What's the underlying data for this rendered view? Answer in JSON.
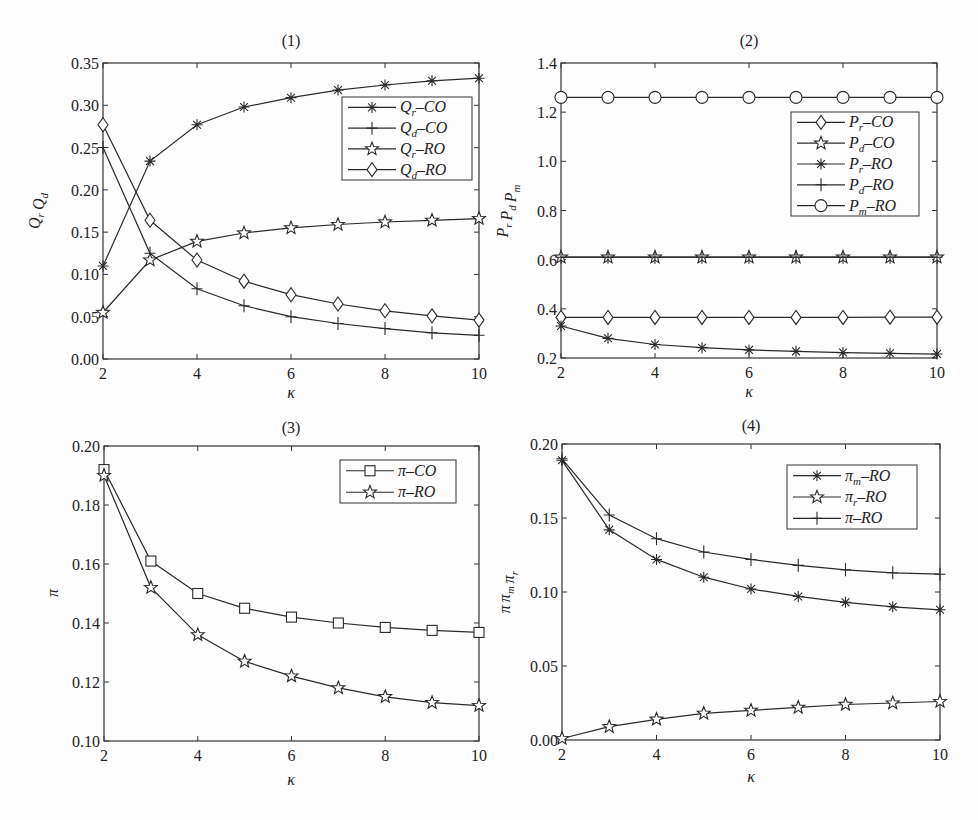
{
  "figure": {
    "panels": [
      "(1)",
      "(2)",
      "(3)",
      "(4)"
    ]
  },
  "colors": {
    "line": "#2a2a2a",
    "background": "#fdfdfd",
    "frame": "#333333"
  },
  "chart_data": [
    {
      "id": "panel-1",
      "type": "line",
      "title": "(1)",
      "xlabel": "κ",
      "ylabel": "Q_r Q_d",
      "x": [
        2,
        3,
        4,
        5,
        6,
        7,
        8,
        9,
        10
      ],
      "xlim": [
        2,
        10
      ],
      "ylim": [
        0,
        0.35
      ],
      "xticks": [
        2,
        4,
        6,
        8,
        10
      ],
      "yticks": [
        0.0,
        0.05,
        0.1,
        0.15,
        0.2,
        0.25,
        0.3,
        0.35
      ],
      "ytick_labels": [
        "0.00",
        "0.05",
        "0.10",
        "0.15",
        "0.20",
        "0.25",
        "0.30",
        "0.35"
      ],
      "grid": false,
      "legend_position": "upper right",
      "series": [
        {
          "name": "Q_r–CO",
          "label_main": "Q",
          "label_sub": "r",
          "label_rest": "–CO",
          "marker": "asterisk",
          "values": [
            0.11,
            0.234,
            0.277,
            0.298,
            0.309,
            0.318,
            0.324,
            0.329,
            0.332
          ]
        },
        {
          "name": "Q_d–CO",
          "label_main": "Q",
          "label_sub": "d",
          "label_rest": "–CO",
          "marker": "plus",
          "values": [
            0.25,
            0.125,
            0.083,
            0.063,
            0.05,
            0.042,
            0.036,
            0.031,
            0.028
          ]
        },
        {
          "name": "Q_r–RO",
          "label_main": "Q",
          "label_sub": "r",
          "label_rest": "–RO",
          "marker": "star",
          "values": [
            0.055,
            0.117,
            0.139,
            0.149,
            0.155,
            0.159,
            0.162,
            0.164,
            0.166
          ]
        },
        {
          "name": "Q_d–RO",
          "label_main": "Q",
          "label_sub": "d",
          "label_rest": "–RO",
          "marker": "diamond",
          "values": [
            0.277,
            0.164,
            0.117,
            0.092,
            0.076,
            0.065,
            0.057,
            0.051,
            0.046
          ]
        }
      ]
    },
    {
      "id": "panel-2",
      "type": "line",
      "title": "(2)",
      "xlabel": "κ",
      "ylabel": "P_r P_d P_m",
      "x": [
        2,
        3,
        4,
        5,
        6,
        7,
        8,
        9,
        10
      ],
      "xlim": [
        2,
        10
      ],
      "ylim": [
        0.2,
        1.4
      ],
      "xticks": [
        2,
        4,
        6,
        8,
        10
      ],
      "yticks": [
        0.2,
        0.4,
        0.6,
        0.8,
        1.0,
        1.2,
        1.4
      ],
      "ytick_labels": [
        "0.2",
        "0.4",
        "0.6",
        "0.8",
        "1.0",
        "1.2",
        "1.4"
      ],
      "grid": false,
      "legend_position": "upper right",
      "series": [
        {
          "name": "P_r–CO",
          "label_main": "P",
          "label_sub": "r",
          "label_rest": "–CO",
          "marker": "diamond",
          "values": [
            0.365,
            0.365,
            0.365,
            0.365,
            0.365,
            0.365,
            0.365,
            0.366,
            0.366
          ]
        },
        {
          "name": "P_d–CO",
          "label_main": "P",
          "label_sub": "d",
          "label_rest": "–CO",
          "marker": "star",
          "values": [
            0.61,
            0.61,
            0.61,
            0.61,
            0.61,
            0.61,
            0.61,
            0.61,
            0.61
          ]
        },
        {
          "name": "P_r–RO",
          "label_main": "P",
          "label_sub": "r",
          "label_rest": "–RO",
          "marker": "asterisk",
          "values": [
            0.33,
            0.28,
            0.255,
            0.242,
            0.233,
            0.227,
            0.222,
            0.219,
            0.216
          ]
        },
        {
          "name": "P_d–RO",
          "label_main": "P",
          "label_sub": "d",
          "label_rest": "–RO",
          "marker": "plus",
          "values": [
            0.61,
            0.61,
            0.61,
            0.61,
            0.61,
            0.61,
            0.61,
            0.61,
            0.61
          ]
        },
        {
          "name": "P_m–RO",
          "label_main": "P",
          "label_sub": "m",
          "label_rest": "–RO",
          "marker": "circle",
          "values": [
            1.26,
            1.26,
            1.26,
            1.26,
            1.26,
            1.26,
            1.26,
            1.26,
            1.26
          ]
        }
      ]
    },
    {
      "id": "panel-3",
      "type": "line",
      "title": "(3)",
      "xlabel": "κ",
      "ylabel": "π",
      "x": [
        2,
        3,
        4,
        5,
        6,
        7,
        8,
        9,
        10
      ],
      "xlim": [
        2,
        10
      ],
      "ylim": [
        0.1,
        0.2
      ],
      "xticks": [
        2,
        4,
        6,
        8,
        10
      ],
      "yticks": [
        0.1,
        0.12,
        0.14,
        0.16,
        0.18,
        0.2
      ],
      "ytick_labels": [
        "0.10",
        "0.12",
        "0.14",
        "0.16",
        "0.18",
        "0.20"
      ],
      "grid": false,
      "legend_position": "upper right",
      "series": [
        {
          "name": "π–CO",
          "label_main": "π",
          "label_sub": "",
          "label_rest": "–CO",
          "marker": "square",
          "values": [
            0.192,
            0.161,
            0.15,
            0.145,
            0.142,
            0.14,
            0.1385,
            0.1375,
            0.1368
          ]
        },
        {
          "name": "π–RO",
          "label_main": "π",
          "label_sub": "",
          "label_rest": "–RO",
          "marker": "star",
          "values": [
            0.19,
            0.152,
            0.136,
            0.127,
            0.122,
            0.118,
            0.115,
            0.113,
            0.112
          ]
        }
      ]
    },
    {
      "id": "panel-4",
      "type": "line",
      "title": "(4)",
      "xlabel": "κ",
      "ylabel": "π π_m π_r",
      "x": [
        2,
        3,
        4,
        5,
        6,
        7,
        8,
        9,
        10
      ],
      "xlim": [
        2,
        10
      ],
      "ylim": [
        0.0,
        0.2
      ],
      "xticks": [
        2,
        4,
        6,
        8,
        10
      ],
      "yticks": [
        0.0,
        0.05,
        0.1,
        0.15,
        0.2
      ],
      "ytick_labels": [
        "0.00",
        "0.05",
        "0.10",
        "0.15",
        "0.20"
      ],
      "grid": false,
      "legend_position": "upper right",
      "series": [
        {
          "name": "π_m–RO",
          "label_main": "π",
          "label_sub": "m",
          "label_rest": "–RO",
          "marker": "asterisk",
          "values": [
            0.189,
            0.142,
            0.122,
            0.11,
            0.102,
            0.097,
            0.093,
            0.09,
            0.088
          ]
        },
        {
          "name": "π_r–RO",
          "label_main": "π",
          "label_sub": "r",
          "label_rest": "–RO",
          "marker": "star",
          "values": [
            0.001,
            0.009,
            0.014,
            0.018,
            0.02,
            0.022,
            0.024,
            0.025,
            0.026
          ]
        },
        {
          "name": "π–RO",
          "label_main": "π",
          "label_sub": "",
          "label_rest": "–RO",
          "marker": "plus",
          "values": [
            0.19,
            0.152,
            0.136,
            0.127,
            0.122,
            0.118,
            0.115,
            0.113,
            0.112
          ]
        }
      ]
    }
  ]
}
